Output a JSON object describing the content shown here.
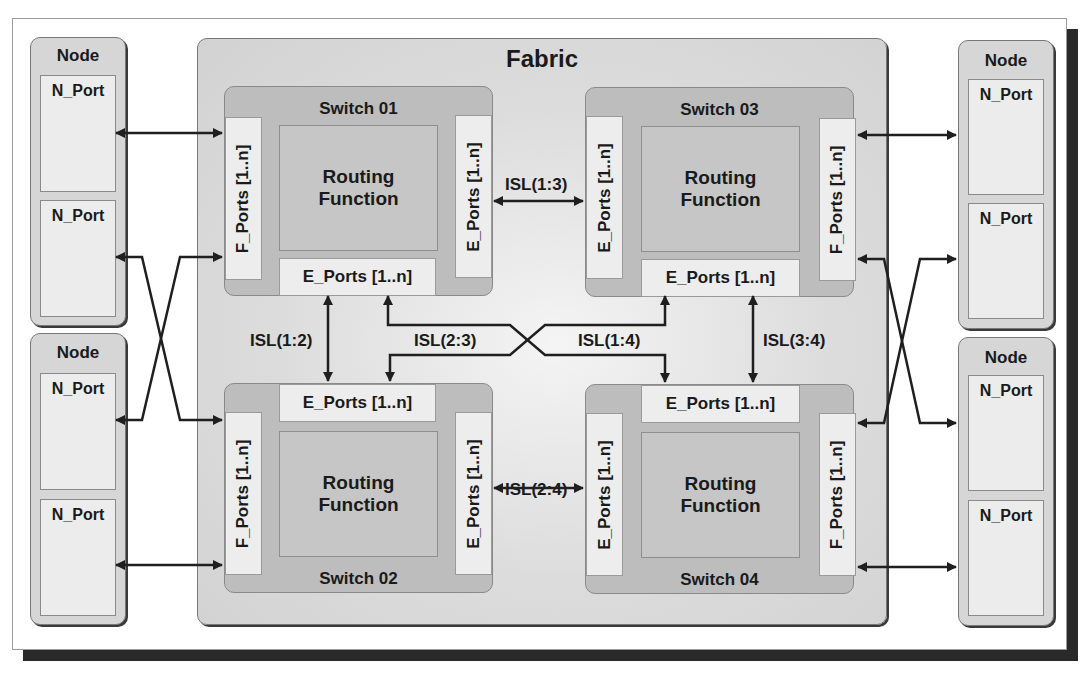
{
  "fabric": {
    "title": "Fabric"
  },
  "nodes": [
    {
      "title": "Node",
      "ports": [
        "N_Port",
        "N_Port"
      ]
    },
    {
      "title": "Node",
      "ports": [
        "N_Port",
        "N_Port"
      ]
    },
    {
      "title": "Node",
      "ports": [
        "N_Port",
        "N_Port"
      ]
    },
    {
      "title": "Node",
      "ports": [
        "N_Port",
        "N_Port"
      ]
    }
  ],
  "switches": [
    {
      "title": "Switch 01",
      "routing": "Routing Function",
      "f_ports": "F_Ports [1..n]",
      "e_ports_side": "E_Ports [1..n]",
      "e_ports_bottom": "E_Ports [1..n]"
    },
    {
      "title": "Switch 02",
      "routing": "Routing Function",
      "f_ports": "F_Ports [1..n]",
      "e_ports_side": "E_Ports [1..n]",
      "e_ports_top": "E_Ports [1..n]"
    },
    {
      "title": "Switch 03",
      "routing": "Routing Function",
      "f_ports": "F_Ports [1..n]",
      "e_ports_side": "E_Ports [1..n]",
      "e_ports_bottom": "E_Ports [1..n]"
    },
    {
      "title": "Switch 04",
      "routing": "Routing Function",
      "f_ports": "F_Ports [1..n]",
      "e_ports_side": "E_Ports [1..n]",
      "e_ports_top": "E_Ports [1..n]"
    }
  ],
  "isl": {
    "s1_s3": "ISL(1:3)",
    "s1_s2": "ISL(1:2)",
    "s2_s3": "ISL(2:3)",
    "s1_s4": "ISL(1:4)",
    "s3_s4": "ISL(3:4)",
    "s2_s4": "ISL(2:4)"
  }
}
